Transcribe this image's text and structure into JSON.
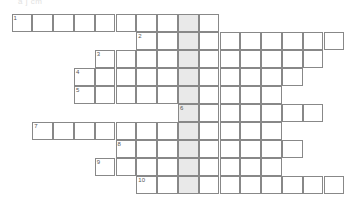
{
  "document": {
    "type": "crossword-puzzle",
    "title_faint": "a    j    cm"
  },
  "grid": {
    "cell_width": 20.8,
    "cell_height": 18,
    "origin_x": 12,
    "origin_y": 14,
    "shaded_column": 8,
    "shaded_color": "#e9e9e9",
    "border_color": "#888888",
    "cell_color": "#ffffff",
    "columns": 16,
    "rows": 10
  },
  "entries": [
    {
      "number": "1",
      "row": 0,
      "start_col": 0,
      "length": 10
    },
    {
      "number": "2",
      "row": 1,
      "start_col": 6,
      "length": 10
    },
    {
      "number": "3",
      "row": 2,
      "start_col": 4,
      "length": 11
    },
    {
      "number": "4",
      "row": 3,
      "start_col": 3,
      "length": 11
    },
    {
      "number": "5",
      "row": 4,
      "start_col": 3,
      "length": 10
    },
    {
      "number": "6",
      "row": 5,
      "start_col": 8,
      "length": 7
    },
    {
      "number": "7",
      "row": 6,
      "start_col": 1,
      "length": 12
    },
    {
      "number": "8",
      "row": 7,
      "start_col": 5,
      "length": 9
    },
    {
      "number": "9",
      "row": 8,
      "start_col": 4,
      "length": 9
    },
    {
      "number": "10",
      "row": 9,
      "start_col": 6,
      "length": 10
    }
  ]
}
